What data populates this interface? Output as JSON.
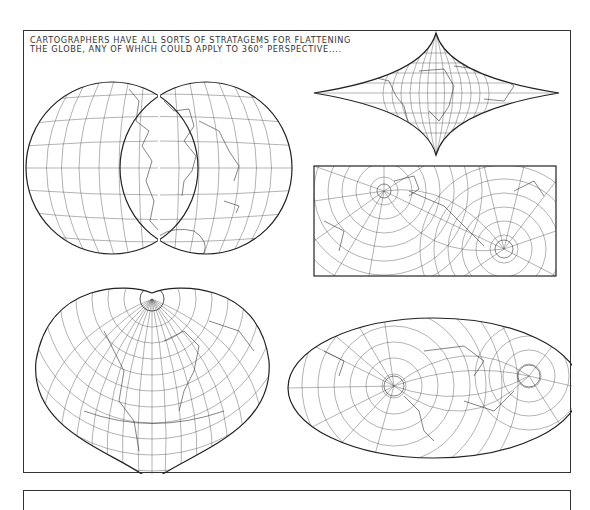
{
  "comic": {
    "caption": {
      "line1": "CARTOGRAPHERS HAVE ALL SORTS OF STRATAGEMS FOR FLATTENING",
      "line2": "THE GLOBE, ANY OF WHICH COULD APPLY TO 360° PERSPECTIVE...."
    },
    "maps": [
      {
        "id": "interrupted-twin-hemispheres",
        "description": "Two overlapping circular hemispheres (interrupted globular projection)",
        "position": "top-left"
      },
      {
        "id": "pointed-lens",
        "description": "Cusped lens-shaped world projection with poles as points",
        "position": "top-right"
      },
      {
        "id": "rectangular-oblique",
        "description": "Rectangular oblique projection with two polar circles",
        "position": "middle-right"
      },
      {
        "id": "heart-shaped",
        "description": "Heart-shaped (cordiform/Bonne) projection",
        "position": "bottom-left"
      },
      {
        "id": "oblique-ellipse",
        "description": "Elliptical oblique (Mollweide-like) projection",
        "position": "bottom-right"
      }
    ],
    "colors": {
      "ink": "#222222",
      "paper": "#ffffff",
      "grid": "#555555"
    }
  }
}
